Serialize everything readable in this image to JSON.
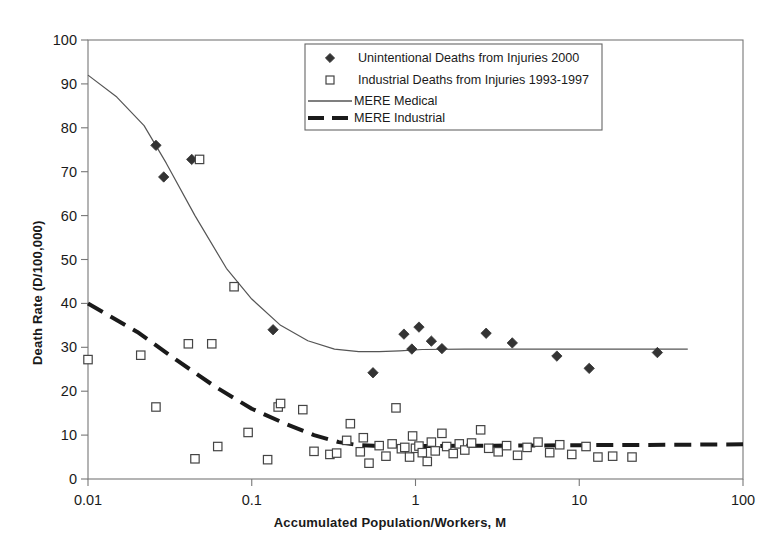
{
  "chart_data": {
    "type": "scatter",
    "title": "",
    "xlabel": "Accumulated Population/Workers, M",
    "ylabel": "Death Rate (D/100,000)",
    "xscale": "log",
    "yscale": "linear",
    "xlim": [
      0.01,
      100
    ],
    "ylim": [
      0,
      100
    ],
    "grid": false,
    "legend_position": "top-center",
    "xticks": [
      "0.01",
      "0.1",
      "1",
      "10",
      "100"
    ],
    "xtick_values": [
      0.01,
      0.1,
      1,
      10,
      100
    ],
    "yticks": [
      "0",
      "10",
      "20",
      "30",
      "40",
      "50",
      "60",
      "70",
      "80",
      "90",
      "100"
    ],
    "ytick_values": [
      0,
      10,
      20,
      30,
      40,
      50,
      60,
      70,
      80,
      90,
      100
    ],
    "series": [
      {
        "name": "Unintentional Deaths from Injuries 2000",
        "marker": "filled-diamond",
        "color": "#333333",
        "points": [
          [
            0.026,
            76.0
          ],
          [
            0.029,
            68.8
          ],
          [
            0.043,
            72.8
          ],
          [
            0.135,
            34.0
          ],
          [
            0.55,
            24.2
          ],
          [
            0.85,
            33.0
          ],
          [
            0.95,
            29.6
          ],
          [
            1.05,
            34.6
          ],
          [
            1.25,
            31.4
          ],
          [
            1.45,
            29.7
          ],
          [
            2.7,
            33.2
          ],
          [
            3.9,
            31.0
          ],
          [
            7.3,
            28.0
          ],
          [
            11.5,
            25.2
          ],
          [
            30.0,
            28.8
          ]
        ]
      },
      {
        "name": "Industrial Deaths from Injuries 1993-1997",
        "marker": "open-square",
        "color": "#444444",
        "points": [
          [
            0.01,
            27.2
          ],
          [
            0.021,
            28.2
          ],
          [
            0.026,
            16.4
          ],
          [
            0.041,
            30.8
          ],
          [
            0.045,
            4.6
          ],
          [
            0.048,
            72.8
          ],
          [
            0.057,
            30.8
          ],
          [
            0.062,
            7.4
          ],
          [
            0.078,
            43.8
          ],
          [
            0.095,
            10.6
          ],
          [
            0.125,
            4.4
          ],
          [
            0.145,
            16.4
          ],
          [
            0.15,
            17.2
          ],
          [
            0.205,
            15.8
          ],
          [
            0.24,
            6.3
          ],
          [
            0.3,
            5.6
          ],
          [
            0.33,
            5.9
          ],
          [
            0.38,
            8.8
          ],
          [
            0.4,
            12.6
          ],
          [
            0.46,
            6.2
          ],
          [
            0.48,
            9.4
          ],
          [
            0.52,
            3.6
          ],
          [
            0.6,
            7.6
          ],
          [
            0.66,
            5.2
          ],
          [
            0.72,
            8.0
          ],
          [
            0.76,
            16.2
          ],
          [
            0.82,
            6.9
          ],
          [
            0.86,
            7.2
          ],
          [
            0.92,
            5.0
          ],
          [
            0.96,
            9.8
          ],
          [
            1.0,
            7.0
          ],
          [
            1.05,
            7.5
          ],
          [
            1.1,
            6.0
          ],
          [
            1.18,
            4.0
          ],
          [
            1.25,
            8.4
          ],
          [
            1.32,
            6.4
          ],
          [
            1.45,
            10.4
          ],
          [
            1.55,
            7.4
          ],
          [
            1.7,
            5.8
          ],
          [
            1.85,
            8.0
          ],
          [
            2.0,
            6.6
          ],
          [
            2.2,
            8.2
          ],
          [
            2.5,
            11.2
          ],
          [
            2.8,
            7.0
          ],
          [
            3.2,
            6.2
          ],
          [
            3.6,
            7.6
          ],
          [
            4.2,
            5.4
          ],
          [
            4.8,
            7.2
          ],
          [
            5.6,
            8.4
          ],
          [
            6.6,
            6.0
          ],
          [
            7.6,
            7.8
          ],
          [
            9.0,
            5.6
          ],
          [
            11.0,
            7.4
          ],
          [
            13.0,
            5.0
          ],
          [
            16.0,
            5.2
          ],
          [
            21.0,
            5.0
          ]
        ]
      }
    ],
    "fit_lines": [
      {
        "name": "MERE Medical",
        "style": "solid",
        "width": 1.2,
        "color": "#555555",
        "points": [
          [
            0.01,
            92.0
          ],
          [
            0.015,
            87.0
          ],
          [
            0.022,
            80.5
          ],
          [
            0.03,
            72.0
          ],
          [
            0.045,
            60.0
          ],
          [
            0.07,
            48.0
          ],
          [
            0.1,
            41.0
          ],
          [
            0.15,
            35.0
          ],
          [
            0.22,
            31.5
          ],
          [
            0.32,
            29.6
          ],
          [
            0.45,
            29.0
          ],
          [
            0.6,
            29.0
          ],
          [
            0.8,
            29.2
          ],
          [
            1.1,
            29.5
          ],
          [
            2.0,
            29.6
          ],
          [
            5.0,
            29.6
          ],
          [
            15.0,
            29.6
          ],
          [
            46.0,
            29.6
          ]
        ]
      },
      {
        "name": "MERE Industrial",
        "style": "dashed",
        "width": 4.0,
        "color": "#1a1a1a",
        "points": [
          [
            0.01,
            40.0
          ],
          [
            0.02,
            33.5
          ],
          [
            0.035,
            27.0
          ],
          [
            0.06,
            21.0
          ],
          [
            0.1,
            16.0
          ],
          [
            0.16,
            12.6
          ],
          [
            0.24,
            10.0
          ],
          [
            0.34,
            8.4
          ],
          [
            0.45,
            7.7
          ],
          [
            0.6,
            7.5
          ],
          [
            1.0,
            7.5
          ],
          [
            3.0,
            7.6
          ],
          [
            10.0,
            7.7
          ],
          [
            40.0,
            7.8
          ],
          [
            100.0,
            7.9
          ]
        ]
      }
    ]
  },
  "legend": {
    "entries": [
      {
        "label": "Unintentional Deaths from Injuries 2000",
        "symbol": "filled-diamond"
      },
      {
        "label": "Industrial Deaths from Injuries 1993-1997",
        "symbol": "open-square"
      },
      {
        "label": "MERE Medical",
        "symbol": "solid-line"
      },
      {
        "label": "MERE Industrial",
        "symbol": "dashed-line"
      }
    ]
  },
  "colors": {
    "axis": "#777777",
    "text": "#1a1a1a",
    "marker_fill": "#333333",
    "marker_stroke": "#444444",
    "medical_line": "#555555",
    "industrial_line": "#1a1a1a"
  }
}
